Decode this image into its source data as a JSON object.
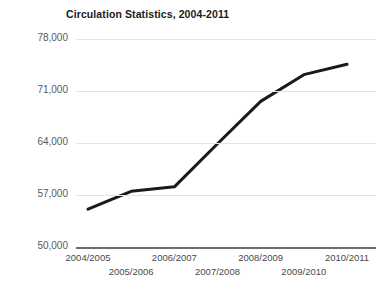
{
  "chart_data": {
    "type": "line",
    "title": "Circulation Statistics, 2004-2011",
    "xlabel": "",
    "ylabel": "",
    "categories": [
      "2004/2005",
      "2005/2006",
      "2006/2007",
      "2007/2008",
      "2008/2009",
      "2009/2010",
      "2010/2011"
    ],
    "values": [
      55100,
      57500,
      58100,
      63900,
      69600,
      73200,
      74600
    ],
    "series": [
      {
        "name": "Circulation",
        "values": [
          55100,
          57500,
          58100,
          63900,
          69600,
          73200,
          74600
        ],
        "color": "#1a1a1a"
      }
    ],
    "ylim": [
      50000,
      78000
    ],
    "ytick_values": [
      50000,
      57000,
      64000,
      71000,
      78000
    ],
    "ytick_labels": [
      "50,000",
      "57,000",
      "64,000",
      "71,000",
      "78,000"
    ],
    "grid": true,
    "grid_color": "#e4e4e4",
    "axis_color": "#6e6e6e",
    "legend": "none",
    "background": "#ffffff"
  },
  "axis": {
    "y": {
      "ticks": [
        {
          "label": "78,000",
          "value": 78000
        },
        {
          "label": "71,000",
          "value": 71000
        },
        {
          "label": "64,000",
          "value": 64000
        },
        {
          "label": "57,000",
          "value": 57000
        },
        {
          "label": "50,000",
          "value": 50000
        }
      ]
    },
    "x": {
      "ticks": [
        {
          "label": "2004/2005",
          "row": "top"
        },
        {
          "label": "2005/2006",
          "row": "bottom"
        },
        {
          "label": "2006/2007",
          "row": "top"
        },
        {
          "label": "2007/2008",
          "row": "bottom"
        },
        {
          "label": "2008/2009",
          "row": "top"
        },
        {
          "label": "2009/2010",
          "row": "bottom"
        },
        {
          "label": "2010/2011",
          "row": "top"
        }
      ]
    }
  }
}
